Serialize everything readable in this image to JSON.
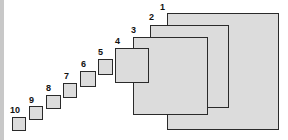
{
  "diagram": {
    "fill_color": "#dcdcdc",
    "border_color": "#2a2a2a",
    "boxes": [
      {
        "label": "1",
        "x": 167,
        "y": 13,
        "w": 112,
        "h": 117,
        "lx": 160,
        "ly": 3
      },
      {
        "label": "2",
        "x": 150,
        "y": 25,
        "w": 79,
        "h": 83,
        "lx": 149,
        "ly": 13
      },
      {
        "label": "3",
        "x": 133,
        "y": 37,
        "w": 75,
        "h": 78,
        "lx": 131,
        "ly": 26
      },
      {
        "label": "4",
        "x": 115,
        "y": 48,
        "w": 34,
        "h": 35,
        "lx": 115,
        "ly": 37
      },
      {
        "label": "5",
        "x": 98,
        "y": 59,
        "w": 15,
        "h": 16,
        "lx": 98,
        "ly": 48
      },
      {
        "label": "6",
        "x": 80,
        "y": 71,
        "w": 16,
        "h": 16,
        "lx": 81,
        "ly": 60
      },
      {
        "label": "7",
        "x": 63,
        "y": 83,
        "w": 14,
        "h": 15,
        "lx": 64,
        "ly": 72
      },
      {
        "label": "8",
        "x": 46,
        "y": 95,
        "w": 15,
        "h": 14,
        "lx": 46,
        "ly": 84
      },
      {
        "label": "9",
        "x": 29,
        "y": 106,
        "w": 14,
        "h": 14,
        "lx": 29,
        "ly": 96
      },
      {
        "label": "10",
        "x": 12,
        "y": 117,
        "w": 14,
        "h": 14,
        "lx": 10,
        "ly": 106
      }
    ]
  }
}
